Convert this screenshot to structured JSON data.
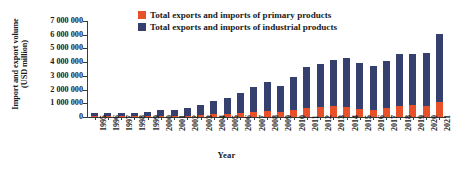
{
  "chart_data": {
    "type": "bar",
    "subtype": "stacked",
    "title": "",
    "xlabel": "Year",
    "ylabel": "Import and export volume (USD million)",
    "ylabel_line1": "Import and export volume",
    "ylabel_line2": "(USD million)",
    "ylim": [
      0,
      7000000
    ],
    "ytick_step": 1000000,
    "grid": false,
    "legend_position": "top-center",
    "categories": [
      "1995",
      "1996",
      "1997",
      "1998",
      "1999",
      "2000",
      "2001",
      "2002",
      "2003",
      "2004",
      "2005",
      "2006",
      "2007",
      "2008",
      "2009",
      "2010",
      "2011",
      "2012",
      "2013",
      "2014",
      "2015",
      "2016",
      "2017",
      "2018",
      "2019",
      "2020",
      "2021"
    ],
    "ytick_labels": [
      "0",
      "1 000 000",
      "2 000 000",
      "3 000 000",
      "4 000 000",
      "5 000 000",
      "6 000 000",
      "7 000 000"
    ],
    "series": [
      {
        "name": "Total exports and imports of primary products",
        "color": "#e8502a",
        "values": [
          40000,
          40000,
          45000,
          40000,
          55000,
          80000,
          80000,
          95000,
          140000,
          190000,
          230000,
          280000,
          350000,
          450000,
          390000,
          530000,
          680000,
          740000,
          780000,
          760000,
          550000,
          530000,
          660000,
          830000,
          860000,
          800000,
          1080000
        ]
      },
      {
        "name": "Total exports and imports of industrial products",
        "color": "#36406e",
        "values": [
          240000,
          240000,
          280000,
          280000,
          330000,
          400000,
          440000,
          530000,
          710000,
          980000,
          1190000,
          1480000,
          1830000,
          2090000,
          1860000,
          2420000,
          2950000,
          3100000,
          3390000,
          3510000,
          3410000,
          3160000,
          3440000,
          3800000,
          3750000,
          3870000,
          5000000
        ]
      }
    ],
    "totals": [
      280000,
      280000,
      325000,
      320000,
      385000,
      480000,
      520000,
      625000,
      850000,
      1170000,
      1420000,
      1760000,
      2180000,
      2540000,
      2250000,
      2950000,
      3630000,
      3840000,
      4170000,
      4270000,
      3960000,
      3690000,
      4100000,
      4630000,
      4610000,
      4670000,
      6080000
    ],
    "legend": [
      {
        "label": "Total exports and imports of primary products",
        "color": "#e8502a",
        "swatch": "legend-swatch-primary"
      },
      {
        "label": "Total exports and imports of industrial products",
        "color": "#36406e",
        "swatch": "legend-swatch-industrial"
      }
    ]
  }
}
